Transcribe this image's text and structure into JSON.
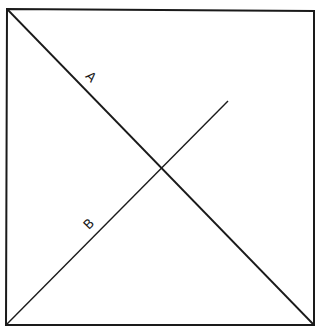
{
  "diagram": {
    "stroke_color": "#1a1a1a",
    "background": "#ffffff",
    "square": {
      "corners": [
        [
          7,
          9
        ],
        [
          314,
          11
        ],
        [
          314,
          325
        ],
        [
          6,
          325
        ]
      ]
    },
    "lines": [
      {
        "label": "A",
        "from": [
          7,
          9
        ],
        "to": [
          314,
          325
        ],
        "label_pos": [
          88,
          80
        ],
        "label_rotate": 45
      },
      {
        "label": "B",
        "from": [
          6,
          325
        ],
        "to": [
          228,
          101
        ],
        "label_pos": [
          92,
          227
        ],
        "label_rotate": -45
      }
    ],
    "intersection": [
      161,
      167
    ]
  }
}
